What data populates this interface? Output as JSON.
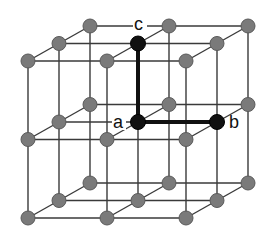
{
  "diagram": {
    "title": "",
    "colors": {
      "edge": "#3a3a3a",
      "atom": "#7a7a7a",
      "key_atom": "#111111",
      "vector": "#111111",
      "background": "#ffffff"
    },
    "grid": {
      "size": 3,
      "origin": [
        28,
        218
      ],
      "x_step": [
        79,
        0
      ],
      "y_step": [
        0,
        -78.5
      ],
      "z_step": [
        31,
        -17.5
      ]
    },
    "labels": {
      "a": "a",
      "b": "b",
      "c": "c"
    },
    "key_atoms": [
      {
        "id": "a",
        "i": 1,
        "j": 1,
        "k": 1
      },
      {
        "id": "b",
        "i": 2,
        "j": 1,
        "k": 1
      },
      {
        "id": "c",
        "i": 1,
        "j": 2,
        "k": 1
      }
    ],
    "vectors": [
      {
        "from": "a",
        "to": "b"
      },
      {
        "from": "a",
        "to": "c"
      }
    ]
  }
}
